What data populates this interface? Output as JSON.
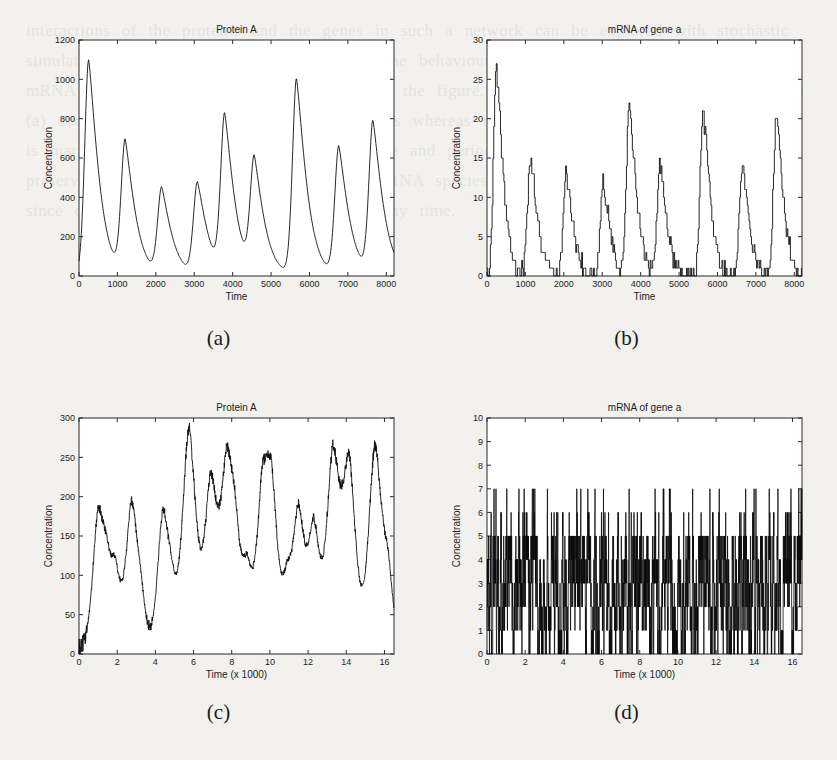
{
  "figure": {
    "panels": [
      {
        "id": "a",
        "caption": "(a)",
        "title": "Protein A",
        "xlabel": "Time",
        "ylabel": "Concentration"
      },
      {
        "id": "b",
        "caption": "(b)",
        "title": "mRNA of gene a",
        "xlabel": "Time",
        "ylabel": "Concentration"
      },
      {
        "id": "c",
        "caption": "(c)",
        "title": "Protein A",
        "xlabel": "Time (x 1000)",
        "ylabel": "Concentration"
      },
      {
        "id": "d",
        "caption": "(d)",
        "title": "mRNA of gene a",
        "xlabel": "Time (x 1000)",
        "ylabel": "Concentration"
      }
    ]
  },
  "colors": {
    "paper": "#f2f1ee",
    "plot_background": "#ffffff",
    "axis": "#2b2b2b",
    "trace": "#101010",
    "text": "#1c1c1c"
  },
  "background_text": "interactions of the proteins and the genes in such a network can be explored with stochastic simulation. For the simple oscillator above, the behaviour of protein A and the corresponding mRNA of gene a are shown in the plots of the figure. Note that the deterministic solution in (a) and (b) gives regular sustained oscillations whereas the stochastic realization in (c) and (d) is markedly noisier, with fluctuating amplitude and period, yet the oscillatory character is preserved. The small copy number of the mRNA species is the principal source of this noise, since only a few molecules are present at any time.",
  "chart_data": [
    {
      "id": "a",
      "type": "line",
      "title": "Protein A",
      "xlabel": "Time",
      "ylabel": "Concentration",
      "xlim": [
        0,
        8200
      ],
      "ylim": [
        0,
        1200
      ],
      "xticks": [
        0,
        1000,
        2000,
        3000,
        4000,
        5000,
        6000,
        7000,
        8000
      ],
      "yticks": [
        0,
        200,
        400,
        600,
        800,
        1000,
        1200
      ],
      "grid": false,
      "legend": null,
      "note": "Deterministic-looking oscillation: 9 asymmetric peaks, sharp rise and slower decay, peak amplitudes vary.",
      "peaks": [
        {
          "t": 250,
          "height": 1100
        },
        {
          "t": 1200,
          "height": 675
        },
        {
          "t": 2150,
          "height": 440
        },
        {
          "t": 3080,
          "height": 470
        },
        {
          "t": 3790,
          "height": 800
        },
        {
          "t": 4560,
          "height": 575
        },
        {
          "t": 5660,
          "height": 1000
        },
        {
          "t": 6760,
          "height": 655
        },
        {
          "t": 7650,
          "height": 775
        }
      ],
      "baseline": 5
    },
    {
      "id": "b",
      "type": "line",
      "title": "mRNA of gene a",
      "xlabel": "Time",
      "ylabel": "Concentration",
      "xlim": [
        0,
        8200
      ],
      "ylim": [
        0,
        30
      ],
      "xticks": [
        0,
        1000,
        2000,
        3000,
        4000,
        5000,
        6000,
        7000,
        8000
      ],
      "yticks": [
        0,
        5,
        10,
        15,
        20,
        25,
        30
      ],
      "grid": false,
      "legend": null,
      "note": "Integer-valued staircase trace; bursts of mRNA preceding each protein peak.",
      "peaks": [
        {
          "t": 240,
          "height": 26
        },
        {
          "t": 1130,
          "height": 15
        },
        {
          "t": 2060,
          "height": 13
        },
        {
          "t": 3020,
          "height": 12
        },
        {
          "t": 3700,
          "height": 22
        },
        {
          "t": 4500,
          "height": 14
        },
        {
          "t": 5620,
          "height": 21
        },
        {
          "t": 6640,
          "height": 14
        },
        {
          "t": 7530,
          "height": 20
        }
      ],
      "baseline": 0
    },
    {
      "id": "c",
      "type": "line",
      "title": "Protein A",
      "xlabel": "Time (x 1000)",
      "ylabel": "Concentration",
      "xlim": [
        0,
        16.5
      ],
      "ylim": [
        0,
        300
      ],
      "xticks": [
        0,
        2,
        4,
        6,
        8,
        10,
        12,
        14,
        16
      ],
      "yticks": [
        0,
        50,
        100,
        150,
        200,
        250,
        300
      ],
      "grid": false,
      "legend": null,
      "note": "Stochastic realization: noisy irregular oscillation, sharp spikes on a noisy near-zero floor.",
      "peaks": [
        {
          "t": 1.0,
          "height": 168
        },
        {
          "t": 1.45,
          "height": 62
        },
        {
          "t": 1.9,
          "height": 88
        },
        {
          "t": 2.75,
          "height": 182
        },
        {
          "t": 3.25,
          "height": 40
        },
        {
          "t": 4.4,
          "height": 172
        },
        {
          "t": 4.85,
          "height": 38
        },
        {
          "t": 5.75,
          "height": 281
        },
        {
          "t": 6.9,
          "height": 209
        },
        {
          "t": 7.75,
          "height": 223
        },
        {
          "t": 8.2,
          "height": 90
        },
        {
          "t": 8.8,
          "height": 95
        },
        {
          "t": 9.6,
          "height": 187
        },
        {
          "t": 10.1,
          "height": 174
        },
        {
          "t": 10.9,
          "height": 74
        },
        {
          "t": 11.5,
          "height": 172
        },
        {
          "t": 12.3,
          "height": 150
        },
        {
          "t": 13.3,
          "height": 248
        },
        {
          "t": 14.15,
          "height": 226
        },
        {
          "t": 15.5,
          "height": 258
        },
        {
          "t": 16.2,
          "height": 76
        }
      ],
      "baseline": 4
    },
    {
      "id": "d",
      "type": "line",
      "title": "mRNA of gene a",
      "xlabel": "Time (x 1000)",
      "ylabel": "Concentration",
      "xlim": [
        0,
        16.5
      ],
      "ylim": [
        0,
        10
      ],
      "xticks": [
        0,
        2,
        4,
        6,
        8,
        10,
        12,
        14,
        16
      ],
      "yticks": [
        0,
        1,
        2,
        3,
        4,
        5,
        6,
        7,
        8,
        9,
        10
      ],
      "grid": false,
      "legend": null,
      "note": "Very dense integer-valued stochastic trace; solid black band from 0 up to about 3-4, frequent excursions to 5, occasional spikes to 6 and 7.",
      "dense_band_top": 4,
      "common_level": 3,
      "spike_levels": [
        5,
        6,
        7
      ],
      "max_value": 7
    }
  ]
}
